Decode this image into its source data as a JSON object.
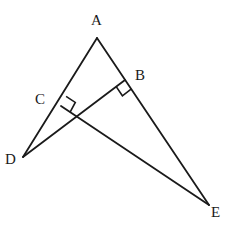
{
  "diagram": {
    "canvas": {
      "width": 231,
      "height": 227,
      "background": "#ffffff"
    },
    "stroke_color": "#1a1a1a",
    "label_color": "#1a1a1a",
    "stroke_width": 1.8,
    "points": {
      "A": {
        "label": "A",
        "x": 97,
        "y": 38,
        "label_x": 91,
        "label_y": 13
      },
      "B": {
        "label": "B",
        "x": 125,
        "y": 80,
        "label_x": 135,
        "label_y": 68
      },
      "C": {
        "label": "C",
        "x": 61,
        "y": 106,
        "label_x": 35,
        "label_y": 92
      },
      "D": {
        "label": "D",
        "x": 23,
        "y": 157,
        "label_x": 5,
        "label_y": 152
      },
      "E": {
        "label": "E",
        "x": 209,
        "y": 205,
        "label_x": 211,
        "label_y": 205
      }
    },
    "segments": [
      {
        "name": "segment-A-D",
        "from": "A",
        "to": "D"
      },
      {
        "name": "segment-A-E",
        "from": "A",
        "to": "E"
      },
      {
        "name": "segment-D-B",
        "from": "D",
        "to": "B"
      },
      {
        "name": "segment-C-E",
        "from": "C",
        "to": "E"
      }
    ],
    "right_angle_marks": [
      {
        "name": "right-angle-mark-C",
        "vertex": "C",
        "size": 11
      },
      {
        "name": "right-angle-mark-B",
        "vertex": "B",
        "size": 11
      }
    ]
  }
}
